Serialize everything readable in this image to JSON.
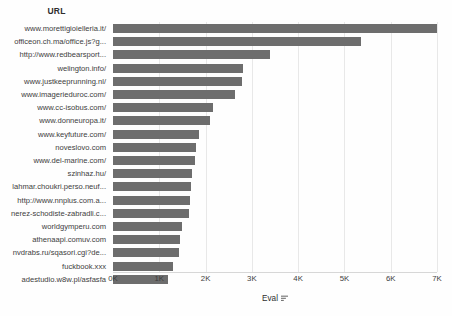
{
  "chart_data": {
    "type": "bar",
    "orientation": "horizontal",
    "title": "",
    "xlabel": "Eval",
    "ylabel": "URL",
    "categories": [
      "www.morettigioielleria.it/",
      "officeon.ch.ma/office.js?g...",
      "http://www.redbearsport...",
      "welington.info/",
      "www.justkeeprunning.nl/",
      "www.imagerieduroc.com/",
      "www.cc-isobus.com/",
      "www.donneuropa.it/",
      "www.keyfuture.com/",
      "noveslovo.com",
      "www.del-marine.com/",
      "szinhaz.hu/",
      "lahmar.choukri.perso.neuf...",
      "http://www.nnplus.com.a...",
      "nerez-schodiste-zabradli.c...",
      "worldgymperu.com",
      "athenaapi.comuv.com",
      "nvdrabs.ru/sqasori.cgi?de...",
      "fuckbook.xxx",
      "adestudio.w8w.pl/asfasfa"
    ],
    "values": [
      7000,
      5350,
      3400,
      2800,
      2780,
      2630,
      2150,
      2100,
      1860,
      1800,
      1780,
      1700,
      1680,
      1660,
      1640,
      1500,
      1450,
      1420,
      1300,
      1180
    ],
    "xlim": [
      0,
      7000
    ],
    "ylim": null,
    "xticks": [
      0,
      1000,
      2000,
      3000,
      4000,
      5000,
      6000,
      7000
    ],
    "xtick_labels": [
      "0K",
      "1K",
      "2K",
      "3K",
      "4K",
      "5K",
      "6K",
      "7K"
    ],
    "grid": true,
    "grid_axis": "x",
    "legend": null,
    "bar_color": "#6d6d6d",
    "background_color": "#ffffff",
    "sort_indicator": "descending"
  },
  "axis": {
    "category_header": "URL",
    "value_title": "Eval",
    "sort_icon_name": "sort-descending-icon"
  }
}
